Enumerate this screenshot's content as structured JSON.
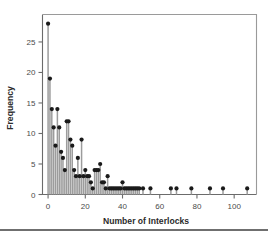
{
  "figure": {
    "background_color": "#ffffff",
    "rule_color": "#6f6f6f"
  },
  "chart_data": {
    "type": "scatter",
    "subtype": "stem-needle-plot",
    "title": "",
    "subtitle": "",
    "xlabel": "Number of Interlocks",
    "ylabel": "Frequency",
    "xlim": [
      -3,
      112
    ],
    "ylim": [
      0,
      29.5
    ],
    "xticks": [
      0,
      20,
      40,
      60,
      80,
      100
    ],
    "xticklabels": [
      "0",
      "20",
      "40",
      "60",
      "80",
      "100"
    ],
    "yticks": [
      0,
      5,
      10,
      15,
      20,
      25
    ],
    "yticklabels": [
      "0",
      "5",
      "10",
      "15",
      "20",
      "25"
    ],
    "grid": false,
    "legend": null,
    "marker_color": "#1a1a1a",
    "stem_color": "#9c9c9c",
    "axis_color": "#6b6b6b",
    "frame_color": "#9a9a9a",
    "x": [
      0,
      1,
      2,
      3,
      4,
      5,
      6,
      7,
      8,
      9,
      10,
      11,
      12,
      13,
      14,
      15,
      16,
      17,
      18,
      19,
      20,
      21,
      22,
      23,
      24,
      25,
      26,
      27,
      28,
      29,
      30,
      31,
      32,
      33,
      34,
      35,
      36,
      37,
      38,
      39,
      40,
      41,
      42,
      43,
      44,
      45,
      46,
      47,
      48,
      49,
      51,
      55,
      66,
      69,
      77,
      87,
      94,
      107
    ],
    "y": [
      28,
      19,
      14,
      11,
      8,
      14,
      11,
      7,
      6,
      4,
      12,
      12,
      9,
      8,
      4,
      3,
      6,
      3,
      9,
      3,
      4,
      3,
      3,
      2,
      1,
      4,
      4,
      4,
      5,
      2,
      2,
      1,
      3,
      1,
      1,
      1,
      1,
      1,
      1,
      1,
      2,
      1,
      1,
      1,
      1,
      1,
      1,
      1,
      1,
      1,
      1,
      1,
      1,
      1,
      1,
      1,
      1,
      1
    ]
  }
}
